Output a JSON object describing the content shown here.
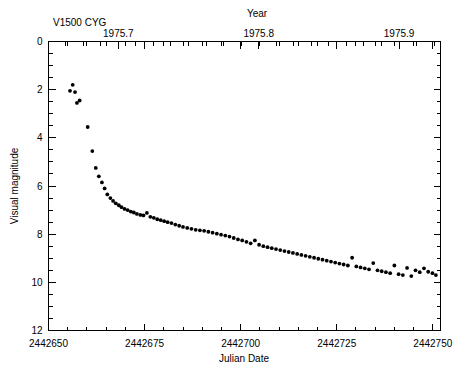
{
  "chart_data": {
    "type": "scatter",
    "title": "V1500 CYG",
    "xlabel": "Julian Date",
    "ylabel": "Visual magnitude",
    "top_axis_label": "Year",
    "xlim": [
      2442650,
      2442752
    ],
    "ylim": [
      0,
      12
    ],
    "y_inverted": true,
    "grid": false,
    "legend": null,
    "marker": "filled-circle",
    "marker_color": "#000000",
    "x_ticks": [
      2442650,
      2442675,
      2442700,
      2442725,
      2442750
    ],
    "x_tick_labels": [
      "2442650",
      "2442675",
      "2442700",
      "2442725",
      "2442750"
    ],
    "x_minor_tick_step": 5,
    "y_ticks": [
      0,
      2,
      4,
      6,
      8,
      10,
      12
    ],
    "y_tick_labels": [
      "0",
      "2",
      "4",
      "6",
      "8",
      "10",
      "12"
    ],
    "y_minor_tick_step": 0.5,
    "top_ticks": [
      1975.7,
      1975.8,
      1975.9
    ],
    "top_tick_labels": [
      "1975.7",
      "1975.8",
      "1975.9"
    ],
    "top_minor_tick_step": 0.0125,
    "x": [
      2442655.6,
      2442656.3,
      2442656.9,
      2442657.4,
      2442658.1,
      2442660.2,
      2442661.4,
      2442662.3,
      2442663.1,
      2442663.9,
      2442664.6,
      2442665.3,
      2442666.1,
      2442666.8,
      2442667.5,
      2442668.3,
      2442669.0,
      2442669.8,
      2442670.6,
      2442671.4,
      2442672.2,
      2442673.0,
      2442673.9,
      2442674.7,
      2442675.6,
      2442676.5,
      2442677.4,
      2442678.3,
      2442679.2,
      2442680.1,
      2442681.0,
      2442682.0,
      2442683.0,
      2442684.0,
      2442685.0,
      2442686.1,
      2442687.2,
      2442688.3,
      2442689.4,
      2442690.5,
      2442691.6,
      2442692.7,
      2442693.8,
      2442694.9,
      2442696.0,
      2442697.1,
      2442698.2,
      2442699.3,
      2442700.4,
      2442701.5,
      2442702.6,
      2442703.7,
      2442704.8,
      2442705.9,
      2442707.0,
      2442708.1,
      2442709.2,
      2442710.3,
      2442711.4,
      2442712.5,
      2442713.6,
      2442714.7,
      2442715.8,
      2442716.9,
      2442718.0,
      2442719.1,
      2442720.2,
      2442721.3,
      2442722.4,
      2442723.5,
      2442724.6,
      2442725.7,
      2442726.8,
      2442727.9,
      2442729.0,
      2442730.1,
      2442731.2,
      2442732.3,
      2442733.4,
      2442734.5,
      2442735.6,
      2442736.7,
      2442737.8,
      2442738.9,
      2442740.0,
      2442741.1,
      2442742.2,
      2442743.3,
      2442744.4,
      2442745.5,
      2442746.6,
      2442747.7,
      2442748.8,
      2442749.9,
      2442750.8
    ],
    "y": [
      2.05,
      1.8,
      2.1,
      2.55,
      2.45,
      3.55,
      4.55,
      5.25,
      5.6,
      5.85,
      6.1,
      6.35,
      6.5,
      6.62,
      6.72,
      6.8,
      6.88,
      6.95,
      7.0,
      7.06,
      7.1,
      7.16,
      7.2,
      7.22,
      7.12,
      7.28,
      7.32,
      7.38,
      7.42,
      7.46,
      7.5,
      7.54,
      7.6,
      7.65,
      7.7,
      7.74,
      7.78,
      7.82,
      7.84,
      7.86,
      7.9,
      7.94,
      7.98,
      8.02,
      8.06,
      8.1,
      8.16,
      8.22,
      8.26,
      8.32,
      8.38,
      8.26,
      8.44,
      8.5,
      8.54,
      8.58,
      8.62,
      8.66,
      8.7,
      8.74,
      8.78,
      8.82,
      8.86,
      8.9,
      8.94,
      8.98,
      9.02,
      9.06,
      9.1,
      9.14,
      9.18,
      9.22,
      9.26,
      9.3,
      8.98,
      9.34,
      9.38,
      9.42,
      9.46,
      9.2,
      9.5,
      9.54,
      9.58,
      9.62,
      9.3,
      9.66,
      9.7,
      9.4,
      9.74,
      9.5,
      9.58,
      9.42,
      9.56,
      9.62,
      9.7
    ]
  }
}
